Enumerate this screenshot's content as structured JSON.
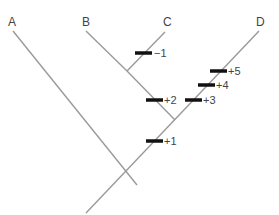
{
  "diagram": {
    "type": "cladogram",
    "taxa": [
      {
        "label": "A",
        "x": 12,
        "y": 16
      },
      {
        "label": "B",
        "x": 83,
        "y": 16
      },
      {
        "label": "C",
        "x": 164,
        "y": 16
      },
      {
        "label": "D",
        "x": 256,
        "y": 16
      }
    ],
    "character_changes": [
      {
        "label": "−1",
        "branch": "C",
        "x": 154,
        "y": 47
      },
      {
        "label": "+2",
        "branch": "B-C stem",
        "x": 165,
        "y": 94
      },
      {
        "label": "+3",
        "branch": "D",
        "x": 203,
        "y": 94
      },
      {
        "label": "+4",
        "branch": "D",
        "x": 217,
        "y": 80
      },
      {
        "label": "+5",
        "branch": "D",
        "x": 229,
        "y": 66
      },
      {
        "label": "+1",
        "branch": "B-C-D stem",
        "x": 165,
        "y": 135
      }
    ],
    "colors": {
      "line": "#9a9a9a",
      "bar": "#111111",
      "text": "#444444"
    }
  }
}
